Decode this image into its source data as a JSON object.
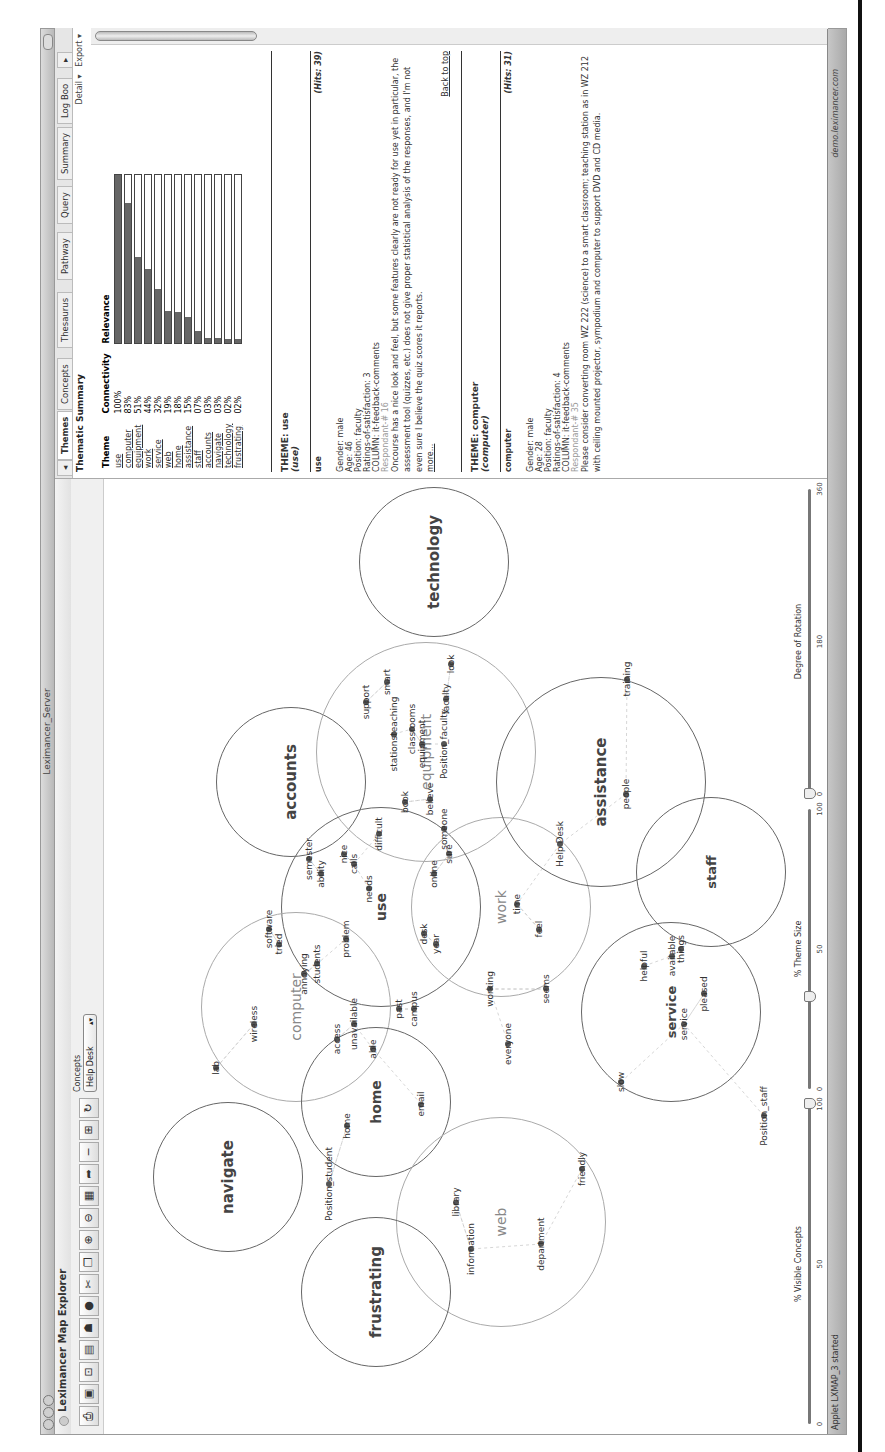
{
  "window": {
    "title": "Leximancer_Server",
    "app_name": "Leximancer Map Explorer"
  },
  "toolbar": {
    "icons": [
      "print-icon",
      "zoom-fit-icon",
      "zoom-reset-icon",
      "save-icon",
      "hat-icon",
      "stop-icon",
      "cut-icon",
      "copy-icon",
      "zoom-in-icon",
      "zoom-out-icon",
      "image-icon",
      "arrow-icon",
      "minus-icon",
      "layout-icon",
      "refresh-icon"
    ],
    "concepts_label": "Concepts",
    "concepts_selected": "Help Desk"
  },
  "map": {
    "themes": [
      {
        "name": "technology",
        "x": 872,
        "y": 330,
        "r": 75,
        "dark": true,
        "size": 15
      },
      {
        "name": "accounts",
        "x": 652,
        "y": 187,
        "r": 75,
        "dark": true,
        "size": 15
      },
      {
        "name": "equipment",
        "x": 682,
        "y": 322,
        "r": 110,
        "dark": false,
        "size": 14
      },
      {
        "name": "use",
        "x": 527,
        "y": 277,
        "r": 100,
        "dark": true,
        "size": 14
      },
      {
        "name": "work",
        "x": 527,
        "y": 397,
        "r": 90,
        "dark": false,
        "size": 14
      },
      {
        "name": "assistance",
        "x": 652,
        "y": 497,
        "r": 105,
        "dark": true,
        "size": 15
      },
      {
        "name": "staff",
        "x": 562,
        "y": 607,
        "r": 75,
        "dark": true,
        "size": 13
      },
      {
        "name": "service",
        "x": 422,
        "y": 567,
        "r": 90,
        "dark": true,
        "size": 13
      },
      {
        "name": "computer",
        "x": 427,
        "y": 192,
        "r": 95,
        "dark": false,
        "size": 14
      },
      {
        "name": "home",
        "x": 332,
        "y": 272,
        "r": 75,
        "dark": true,
        "size": 14
      },
      {
        "name": "navigate",
        "x": 257,
        "y": 124,
        "r": 75,
        "dark": true,
        "size": 15
      },
      {
        "name": "web",
        "x": 212,
        "y": 397,
        "r": 105,
        "dark": false,
        "size": 14
      },
      {
        "name": "frustrating",
        "x": 142,
        "y": 272,
        "r": 75,
        "dark": true,
        "size": 15
      }
    ],
    "concepts": [
      {
        "label": "smart",
        "x": 752,
        "y": 283
      },
      {
        "label": "support",
        "x": 732,
        "y": 262
      },
      {
        "label": "stationsteaching",
        "x": 700,
        "y": 290
      },
      {
        "label": "classrooms",
        "x": 705,
        "y": 308
      },
      {
        "label": "equipment",
        "x": 690,
        "y": 318
      },
      {
        "label": "Position_faculty",
        "x": 690,
        "y": 340
      },
      {
        "label": "faculty",
        "x": 735,
        "y": 342
      },
      {
        "label": "look",
        "x": 770,
        "y": 347
      },
      {
        "label": "believe",
        "x": 635,
        "y": 326
      },
      {
        "label": "book",
        "x": 632,
        "y": 301
      },
      {
        "label": "someone",
        "x": 605,
        "y": 340
      },
      {
        "label": "difficult",
        "x": 600,
        "y": 275
      },
      {
        "label": "nice",
        "x": 580,
        "y": 240
      },
      {
        "label": "calls",
        "x": 570,
        "y": 250
      },
      {
        "label": "semester",
        "x": 575,
        "y": 205
      },
      {
        "label": "ability",
        "x": 560,
        "y": 217
      },
      {
        "label": "needs",
        "x": 545,
        "y": 265
      },
      {
        "label": "online",
        "x": 560,
        "y": 330
      },
      {
        "label": "sure",
        "x": 580,
        "y": 345
      },
      {
        "label": "time",
        "x": 530,
        "y": 413
      },
      {
        "label": "feel",
        "x": 505,
        "y": 435
      },
      {
        "label": "desk",
        "x": 500,
        "y": 320
      },
      {
        "label": "year",
        "x": 490,
        "y": 332
      },
      {
        "label": "problem",
        "x": 495,
        "y": 242
      },
      {
        "label": "students",
        "x": 470,
        "y": 213
      },
      {
        "label": "annoying",
        "x": 460,
        "y": 200
      },
      {
        "label": "software",
        "x": 505,
        "y": 165
      },
      {
        "label": "tried",
        "x": 490,
        "y": 175
      },
      {
        "label": "working",
        "x": 445,
        "y": 386
      },
      {
        "label": "seems",
        "x": 445,
        "y": 442
      },
      {
        "label": "past",
        "x": 425,
        "y": 295
      },
      {
        "label": "campus",
        "x": 425,
        "y": 310
      },
      {
        "label": "unavailable",
        "x": 410,
        "y": 250
      },
      {
        "label": "access",
        "x": 395,
        "y": 233
      },
      {
        "label": "able",
        "x": 385,
        "y": 269
      },
      {
        "label": "wireless",
        "x": 410,
        "y": 150
      },
      {
        "label": "lab",
        "x": 366,
        "y": 112
      },
      {
        "label": "email",
        "x": 330,
        "y": 317
      },
      {
        "label": "home",
        "x": 308,
        "y": 243
      },
      {
        "label": "everyone",
        "x": 390,
        "y": 404
      },
      {
        "label": "Help Desk",
        "x": 590,
        "y": 456
      },
      {
        "label": "people",
        "x": 640,
        "y": 522
      },
      {
        "label": "training",
        "x": 755,
        "y": 523
      },
      {
        "label": "helpful",
        "x": 468,
        "y": 540
      },
      {
        "label": "things",
        "x": 485,
        "y": 577
      },
      {
        "label": "available",
        "x": 478,
        "y": 568
      },
      {
        "label": "pleased",
        "x": 440,
        "y": 600
      },
      {
        "label": "service",
        "x": 410,
        "y": 580
      },
      {
        "label": "slow",
        "x": 352,
        "y": 517
      },
      {
        "label": "Position_staff",
        "x": 318,
        "y": 660
      },
      {
        "label": "Position_student",
        "x": 250,
        "y": 225
      },
      {
        "label": "friendly",
        "x": 265,
        "y": 478
      },
      {
        "label": "library",
        "x": 232,
        "y": 352
      },
      {
        "label": "information",
        "x": 185,
        "y": 367
      },
      {
        "label": "department",
        "x": 190,
        "y": 437
      }
    ]
  },
  "sliders": [
    {
      "label": "% Visible Concepts",
      "min": "0",
      "mid": "50",
      "max": "100",
      "value_pct": 100
    },
    {
      "label": "% Theme Size",
      "min": "0",
      "mid": "50",
      "max": "100",
      "value_pct": 33
    },
    {
      "label": "Degree of Rotation",
      "min": "0",
      "mid": "180",
      "max": "360",
      "value_pct": 0
    }
  ],
  "status": {
    "left": "Applet LXMAP_3 started",
    "right": "demo.leximancer.com"
  },
  "panel": {
    "tabs": [
      "Themes",
      "Concepts",
      "Thesaurus",
      "Pathway",
      "Query",
      "Summary",
      "Log Boo"
    ],
    "active_tab": "Themes",
    "title": "Thematic Summary",
    "detail_link": "Detail ▾",
    "export_link": "Export ▾",
    "table": {
      "headers": [
        "Theme",
        "Connectivity",
        "Relevance"
      ],
      "rows": [
        {
          "theme": "use",
          "connectivity": "100%",
          "value": 100
        },
        {
          "theme": "computer",
          "connectivity": "83%",
          "value": 83
        },
        {
          "theme": "equipment",
          "connectivity": "51%",
          "value": 51
        },
        {
          "theme": "work",
          "connectivity": "44%",
          "value": 44
        },
        {
          "theme": "service",
          "connectivity": "32%",
          "value": 32
        },
        {
          "theme": "web",
          "connectivity": "19%",
          "value": 19
        },
        {
          "theme": "home",
          "connectivity": "18%",
          "value": 18
        },
        {
          "theme": "assistance",
          "connectivity": "15%",
          "value": 15
        },
        {
          "theme": "staff",
          "connectivity": "07%",
          "value": 7
        },
        {
          "theme": "accounts",
          "connectivity": "03%",
          "value": 3
        },
        {
          "theme": "navigate",
          "connectivity": "03%",
          "value": 3
        },
        {
          "theme": "technology",
          "connectivity": "02%",
          "value": 2
        },
        {
          "theme": "frustrating",
          "connectivity": "02%",
          "value": 2
        }
      ]
    },
    "sections": [
      {
        "theme_title": "THEME: use",
        "theme_sub": "(use)",
        "concept": "use",
        "hits": "(Hits: 39)",
        "lines": [
          "Gender: male",
          "Age: 46",
          "Position: faculty",
          "Ratings-of-satisfaction: 3",
          "COLUMN: it-feedback-comments"
        ],
        "respondent": "Respondant-# 16",
        "body": "Oncourse has a nice look and feel, but some features clearly are not ready for use yet in particular, the assessment tool (quizzes, etc.) does not give proper statistical analysis of the responses, and I'm not even sure I believe the quiz scores it reports.",
        "more": "more...",
        "back": "Back to top"
      },
      {
        "theme_title": "THEME: computer",
        "theme_sub": "(computer)",
        "concept": "computer",
        "hits": "(Hits: 31)",
        "lines": [
          "Gender: male",
          "Age: 28",
          "Position: faculty",
          "Ratings-of-satisfaction: 4",
          "COLUMN: it-feedback-comments"
        ],
        "respondent": "Respondant-# 35",
        "body": "Please consider converting room WZ 222 (science) to a smart classroom; teaching station as in WZ 212 with ceiling mounted projector, sympodium and computer to support DVD and CD media."
      }
    ]
  }
}
